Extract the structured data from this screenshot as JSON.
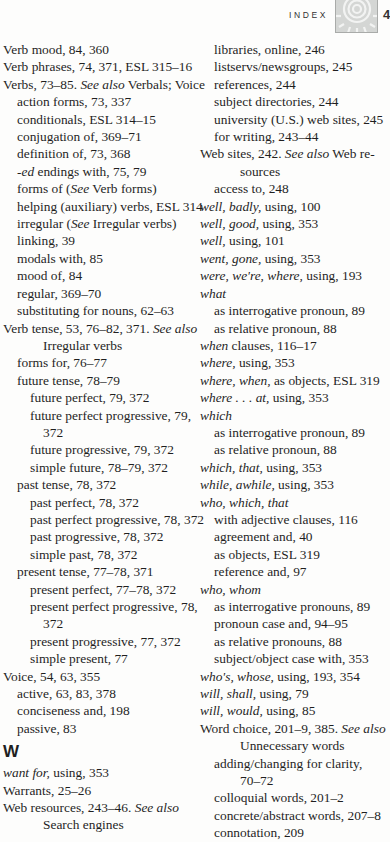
{
  "header": {
    "section_label": "INDEX",
    "page_number": "4",
    "icon": "sun-spiral-icon"
  },
  "left_column": [
    {
      "level": 0,
      "parts": [
        {
          "t": "Verb mood, 84, 360"
        }
      ]
    },
    {
      "level": 0,
      "parts": [
        {
          "t": "Verb phrases, 74, 371, ESL 315–16"
        }
      ]
    },
    {
      "level": 0,
      "parts": [
        {
          "t": "Verbs, 73–85. "
        },
        {
          "t": "See also",
          "i": true
        },
        {
          "t": " Verbals; Voice"
        }
      ]
    },
    {
      "level": 1,
      "parts": [
        {
          "t": "action forms, 73, 337"
        }
      ]
    },
    {
      "level": 1,
      "parts": [
        {
          "t": "conditionals, ESL 314–15"
        }
      ]
    },
    {
      "level": 1,
      "parts": [
        {
          "t": "conjugation of, 369–71"
        }
      ]
    },
    {
      "level": 1,
      "parts": [
        {
          "t": "definition of, 73, 368"
        }
      ]
    },
    {
      "level": 1,
      "parts": [
        {
          "t": "-ed",
          "i": true
        },
        {
          "t": " endings with, 75, 79"
        }
      ]
    },
    {
      "level": 1,
      "parts": [
        {
          "t": "forms of ("
        },
        {
          "t": "See",
          "i": true
        },
        {
          "t": " Verb forms)"
        }
      ]
    },
    {
      "level": 1,
      "parts": [
        {
          "t": "helping (auxiliary) verbs, ESL 314"
        }
      ]
    },
    {
      "level": 1,
      "parts": [
        {
          "t": "irregular ("
        },
        {
          "t": "See",
          "i": true
        },
        {
          "t": " Irregular verbs)"
        }
      ]
    },
    {
      "level": 1,
      "parts": [
        {
          "t": "linking, 39"
        }
      ]
    },
    {
      "level": 1,
      "parts": [
        {
          "t": "modals with, 85"
        }
      ]
    },
    {
      "level": 1,
      "parts": [
        {
          "t": "mood of, 84"
        }
      ]
    },
    {
      "level": 1,
      "parts": [
        {
          "t": "regular, 369–70"
        }
      ]
    },
    {
      "level": 1,
      "parts": [
        {
          "t": "substituting for nouns, 62–63"
        }
      ]
    },
    {
      "level": 0,
      "parts": [
        {
          "t": "Verb tense, 53, 76–82, 371. "
        },
        {
          "t": "See also",
          "i": true
        }
      ]
    },
    {
      "level": "cont",
      "parts": [
        {
          "t": "Irregular verbs"
        }
      ]
    },
    {
      "level": 1,
      "parts": [
        {
          "t": "forms for, 76–77"
        }
      ]
    },
    {
      "level": 1,
      "parts": [
        {
          "t": "future tense, 78–79"
        }
      ]
    },
    {
      "level": 2,
      "parts": [
        {
          "t": "future perfect, 79, 372"
        }
      ]
    },
    {
      "level": 2,
      "parts": [
        {
          "t": "future perfect progressive, 79,"
        }
      ]
    },
    {
      "level": "cont2",
      "parts": [
        {
          "t": "372"
        }
      ]
    },
    {
      "level": 2,
      "parts": [
        {
          "t": "future progressive, 79, 372"
        }
      ]
    },
    {
      "level": 2,
      "parts": [
        {
          "t": "simple future, 78–79, 372"
        }
      ]
    },
    {
      "level": 1,
      "parts": [
        {
          "t": "past tense, 78, 372"
        }
      ]
    },
    {
      "level": 2,
      "parts": [
        {
          "t": "past perfect, 78, 372"
        }
      ]
    },
    {
      "level": 2,
      "parts": [
        {
          "t": "past perfect progressive, 78, 372"
        }
      ]
    },
    {
      "level": 2,
      "parts": [
        {
          "t": "past progressive, 78, 372"
        }
      ]
    },
    {
      "level": 2,
      "parts": [
        {
          "t": "simple past, 78, 372"
        }
      ]
    },
    {
      "level": 1,
      "parts": [
        {
          "t": "present tense, 77–78, 371"
        }
      ]
    },
    {
      "level": 2,
      "parts": [
        {
          "t": "present perfect, 77–78, 372"
        }
      ]
    },
    {
      "level": 2,
      "parts": [
        {
          "t": "present perfect progressive, 78,"
        }
      ]
    },
    {
      "level": "cont2",
      "parts": [
        {
          "t": "372"
        }
      ]
    },
    {
      "level": 2,
      "parts": [
        {
          "t": "present progressive, 77, 372"
        }
      ]
    },
    {
      "level": 2,
      "parts": [
        {
          "t": "simple present, 77"
        }
      ]
    },
    {
      "level": 0,
      "parts": [
        {
          "t": "Voice, 54, 63, 355"
        }
      ]
    },
    {
      "level": 1,
      "parts": [
        {
          "t": "active, 63, 83, 378"
        }
      ]
    },
    {
      "level": 1,
      "parts": [
        {
          "t": "conciseness and, 198"
        }
      ]
    },
    {
      "level": 1,
      "parts": [
        {
          "t": "passive, 83"
        }
      ]
    },
    {
      "level": "letter",
      "parts": [
        {
          "t": "W"
        }
      ]
    },
    {
      "level": 0,
      "parts": [
        {
          "t": "want for,",
          "i": true
        },
        {
          "t": " using, 353"
        }
      ]
    },
    {
      "level": 0,
      "parts": [
        {
          "t": "Warrants, 25–26"
        }
      ]
    },
    {
      "level": 0,
      "parts": [
        {
          "t": "Web resources, 243–46. "
        },
        {
          "t": "See also",
          "i": true
        }
      ]
    },
    {
      "level": "cont",
      "parts": [
        {
          "t": "Search engines"
        }
      ]
    }
  ],
  "right_column": [
    {
      "level": 1,
      "parts": [
        {
          "t": "libraries, online, 246"
        }
      ]
    },
    {
      "level": 1,
      "parts": [
        {
          "t": "listservs/newsgroups, 245"
        }
      ]
    },
    {
      "level": 1,
      "parts": [
        {
          "t": "references, 244"
        }
      ]
    },
    {
      "level": 1,
      "parts": [
        {
          "t": "subject directories, 244"
        }
      ]
    },
    {
      "level": 1,
      "parts": [
        {
          "t": "university (U.S.) web sites, 245"
        }
      ]
    },
    {
      "level": 1,
      "parts": [
        {
          "t": "for writing, 243–44"
        }
      ]
    },
    {
      "level": 0,
      "parts": [
        {
          "t": "Web sites, 242. "
        },
        {
          "t": "See also",
          "i": true
        },
        {
          "t": " Web re-"
        }
      ]
    },
    {
      "level": "cont",
      "parts": [
        {
          "t": "sources"
        }
      ]
    },
    {
      "level": 1,
      "parts": [
        {
          "t": "access to, 248"
        }
      ]
    },
    {
      "level": 0,
      "parts": [
        {
          "t": "well, badly,",
          "i": true
        },
        {
          "t": " using, 100"
        }
      ]
    },
    {
      "level": 0,
      "parts": [
        {
          "t": "well, good,",
          "i": true
        },
        {
          "t": " using, 353"
        }
      ]
    },
    {
      "level": 0,
      "parts": [
        {
          "t": "well,",
          "i": true
        },
        {
          "t": " using, 101"
        }
      ]
    },
    {
      "level": 0,
      "parts": [
        {
          "t": "went, gone,",
          "i": true
        },
        {
          "t": " using, 353"
        }
      ]
    },
    {
      "level": 0,
      "parts": [
        {
          "t": "were, we're, where,",
          "i": true
        },
        {
          "t": " using, 193"
        }
      ]
    },
    {
      "level": 0,
      "parts": [
        {
          "t": "what",
          "i": true
        }
      ]
    },
    {
      "level": 1,
      "parts": [
        {
          "t": "as interrogative pronoun, 89"
        }
      ]
    },
    {
      "level": 1,
      "parts": [
        {
          "t": "as relative pronoun, 88"
        }
      ]
    },
    {
      "level": 0,
      "parts": [
        {
          "t": "when",
          "i": true
        },
        {
          "t": " clauses, 116–17"
        }
      ]
    },
    {
      "level": 0,
      "parts": [
        {
          "t": "where,",
          "i": true
        },
        {
          "t": " using, 353"
        }
      ]
    },
    {
      "level": 0,
      "parts": [
        {
          "t": "where, when,",
          "i": true
        },
        {
          "t": " as objects,  ESL 319"
        }
      ]
    },
    {
      "level": 0,
      "parts": [
        {
          "t": "where . . . at,",
          "i": true
        },
        {
          "t": " using, 353"
        }
      ]
    },
    {
      "level": 0,
      "parts": [
        {
          "t": "which",
          "i": true
        }
      ]
    },
    {
      "level": 1,
      "parts": [
        {
          "t": "as interrogative pronoun, 89"
        }
      ]
    },
    {
      "level": 1,
      "parts": [
        {
          "t": "as relative pronoun, 88"
        }
      ]
    },
    {
      "level": 0,
      "parts": [
        {
          "t": "which, that,",
          "i": true
        },
        {
          "t": " using, 353"
        }
      ]
    },
    {
      "level": 0,
      "parts": [
        {
          "t": "while, awhile,",
          "i": true
        },
        {
          "t": " using, 353"
        }
      ]
    },
    {
      "level": 0,
      "parts": [
        {
          "t": "who, which, that",
          "i": true
        }
      ]
    },
    {
      "level": 1,
      "parts": [
        {
          "t": "with adjective clauses, 116"
        }
      ]
    },
    {
      "level": 1,
      "parts": [
        {
          "t": "agreement and, 40"
        }
      ]
    },
    {
      "level": 1,
      "parts": [
        {
          "t": "as objects,  ESL 319"
        }
      ]
    },
    {
      "level": 1,
      "parts": [
        {
          "t": "reference and, 97"
        }
      ]
    },
    {
      "level": 0,
      "parts": [
        {
          "t": "who, whom",
          "i": true
        }
      ]
    },
    {
      "level": 1,
      "parts": [
        {
          "t": "as interrogative pronouns, 89"
        }
      ]
    },
    {
      "level": 1,
      "parts": [
        {
          "t": "pronoun case and, 94–95"
        }
      ]
    },
    {
      "level": 1,
      "parts": [
        {
          "t": "as relative pronouns, 88"
        }
      ]
    },
    {
      "level": 1,
      "parts": [
        {
          "t": "subject/object case with, 353"
        }
      ]
    },
    {
      "level": 0,
      "parts": [
        {
          "t": "who's, whose,",
          "i": true
        },
        {
          "t": " using, 193, 354"
        }
      ]
    },
    {
      "level": 0,
      "parts": [
        {
          "t": "will, shall,",
          "i": true
        },
        {
          "t": " using, 79"
        }
      ]
    },
    {
      "level": 0,
      "parts": [
        {
          "t": "will, would,",
          "i": true
        },
        {
          "t": " using, 85"
        }
      ]
    },
    {
      "level": 0,
      "parts": [
        {
          "t": "Word choice, 201–9, 385. "
        },
        {
          "t": "See also",
          "i": true
        }
      ]
    },
    {
      "level": "cont",
      "parts": [
        {
          "t": "Unnecessary words"
        }
      ]
    },
    {
      "level": 1,
      "parts": [
        {
          "t": "adding/changing for clarity,"
        }
      ]
    },
    {
      "level": "cont2",
      "parts": [
        {
          "t": "70–72"
        }
      ]
    },
    {
      "level": 1,
      "parts": [
        {
          "t": "colloquial words, 201–2"
        }
      ]
    },
    {
      "level": 1,
      "parts": [
        {
          "t": "concrete/abstract words, 207–8"
        }
      ]
    },
    {
      "level": 1,
      "parts": [
        {
          "t": "connotation, 209"
        }
      ]
    }
  ]
}
